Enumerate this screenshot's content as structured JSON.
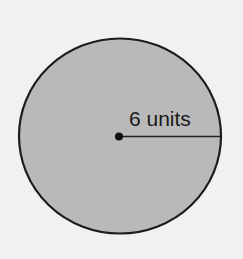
{
  "diagram": {
    "shape": "circle",
    "radius_label": "6 units",
    "colors": {
      "background": "#f1f1ef",
      "fill": "#b9b9b9",
      "stroke": "#1c1c1c"
    }
  }
}
